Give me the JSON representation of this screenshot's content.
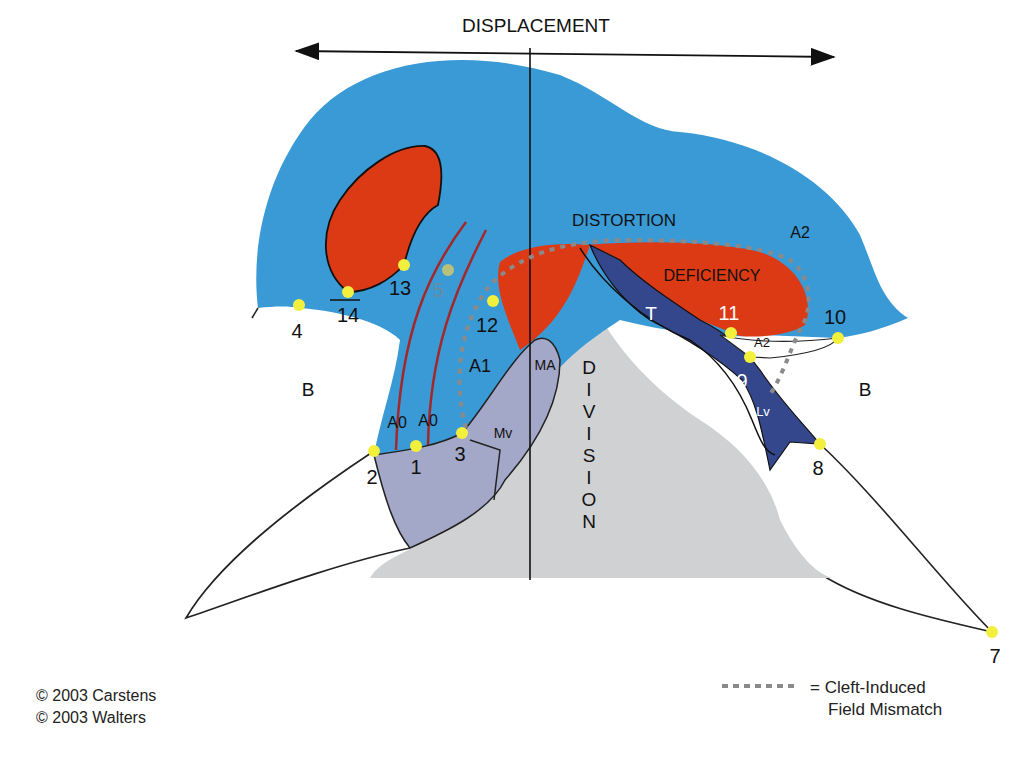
{
  "title": "DISPLACEMENT",
  "regions": {
    "distortion": "DISTORTION",
    "deficiency": "DEFICIENCY",
    "division": [
      "D",
      "I",
      "V",
      "I",
      "S",
      "I",
      "O",
      "N"
    ]
  },
  "zone_labels": {
    "b_left": "B",
    "b_right": "B",
    "a0_left": "A0",
    "a0_right": "A0",
    "a1": "A1",
    "a2_top": "A2",
    "a2_small": "A2",
    "ma": "MA",
    "mv": "Mv",
    "t": "T",
    "la": "LA",
    "lv": "Lv"
  },
  "points": [
    {
      "id": "1",
      "label": "1",
      "x": 416,
      "y": 446
    },
    {
      "id": "2",
      "label": "2",
      "x": 374,
      "y": 451
    },
    {
      "id": "3",
      "label": "3",
      "x": 462,
      "y": 433
    },
    {
      "id": "4",
      "label": "4",
      "x": 299,
      "y": 305
    },
    {
      "id": "5",
      "label": "5",
      "x": 448,
      "y": 270
    },
    {
      "id": "7",
      "label": "7",
      "x": 992,
      "y": 632
    },
    {
      "id": "8",
      "label": "8",
      "x": 820,
      "y": 444
    },
    {
      "id": "9",
      "label": "9",
      "x": 750,
      "y": 357
    },
    {
      "id": "10",
      "label": "10",
      "x": 838,
      "y": 338
    },
    {
      "id": "11",
      "label": "11",
      "x": 731,
      "y": 333
    },
    {
      "id": "12",
      "label": "12",
      "x": 493,
      "y": 301
    },
    {
      "id": "13",
      "label": "13",
      "x": 404,
      "y": 265
    },
    {
      "id": "14",
      "label": "14",
      "x": 348,
      "y": 292
    }
  ],
  "legend": {
    "line1": "= Cleft-Induced",
    "line2": "Field Mismatch"
  },
  "credits": [
    "© 2003 Carstens",
    "© 2003 Walters"
  ],
  "colors": {
    "blue_field": "#3a9ad6",
    "red_field": "#dc3a14",
    "dark_blue": "#35478c",
    "lavender": "#a4a8c8",
    "gray": "#d0d1d3",
    "point": "#f3ef3d",
    "dotted": "#8a8a8a"
  }
}
